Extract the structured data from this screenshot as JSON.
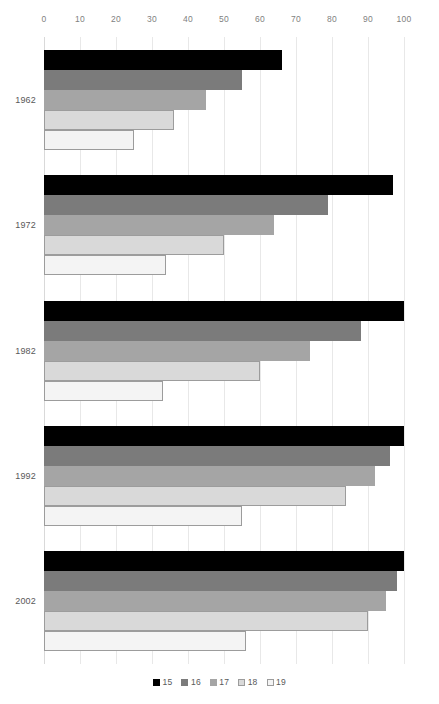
{
  "chart_data": {
    "type": "bar",
    "orientation": "horizontal",
    "title": "",
    "xlabel": "",
    "ylabel": "",
    "categories": [
      "1962",
      "1972",
      "1982",
      "1992",
      "2002"
    ],
    "series": [
      {
        "name": "15",
        "color": "#000000",
        "values": [
          66,
          97,
          100,
          100,
          100
        ]
      },
      {
        "name": "16",
        "color": "#7b7b7b",
        "values": [
          55,
          79,
          88,
          96,
          98
        ]
      },
      {
        "name": "17",
        "color": "#a5a5a5",
        "values": [
          45,
          64,
          74,
          92,
          95
        ]
      },
      {
        "name": "18",
        "color": "#d9d9d9",
        "values": [
          36,
          50,
          60,
          84,
          90
        ]
      },
      {
        "name": "19",
        "color": "#f4f4f4",
        "values": [
          25,
          34,
          33,
          55,
          56
        ]
      }
    ],
    "xlim": [
      0,
      100
    ],
    "xticks": [
      0,
      10,
      20,
      30,
      40,
      50,
      60,
      70,
      80,
      90,
      100
    ],
    "xtick_labels": [
      "0",
      "10",
      "20",
      "30",
      "40",
      "50",
      "60",
      "70",
      "80",
      "90",
      "100"
    ],
    "grid": true,
    "grid_axis": "x",
    "legend": {
      "position": "bottom",
      "entries": [
        "15",
        "16",
        "17",
        "18",
        "19"
      ]
    }
  }
}
